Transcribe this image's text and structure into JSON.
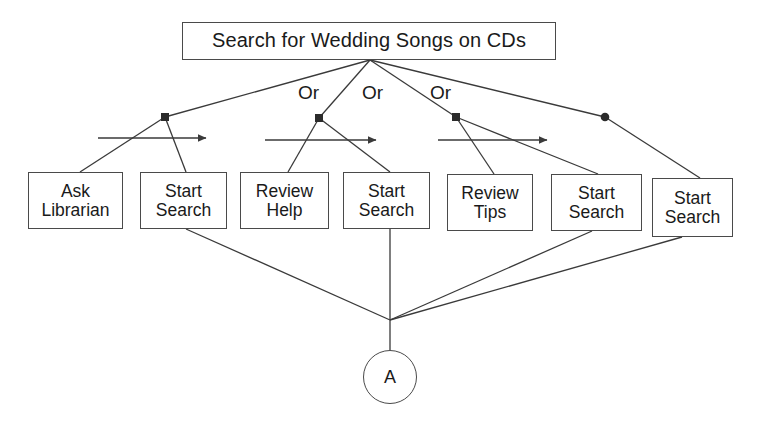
{
  "diagram": {
    "type": "decision-tree-flowchart",
    "root": {
      "label": "Search for Wedding Songs on CDs",
      "box": {
        "x": 182,
        "y": 22,
        "w": 374,
        "h": 38
      }
    },
    "connector_labels": [
      {
        "text": "Or",
        "x": 298,
        "y": 82
      },
      {
        "text": "Or",
        "x": 362,
        "y": 82
      },
      {
        "text": "Or",
        "x": 430,
        "y": 82
      }
    ],
    "branches": [
      {
        "id": "branch-1",
        "junction": {
          "x": 165,
          "y": 117
        },
        "arrow": {
          "x1": 98,
          "y1": 138,
          "x2": 212,
          "y2": 138
        },
        "nodes": [
          {
            "id": "ask-librarian",
            "line1": "Ask",
            "line2": "Librarian",
            "x": 28,
            "y": 172,
            "w": 95,
            "h": 57
          },
          {
            "id": "start-search-1",
            "line1": "Start",
            "line2": "Search",
            "x": 140,
            "y": 172,
            "w": 87,
            "h": 57
          }
        ]
      },
      {
        "id": "branch-2",
        "junction": {
          "x": 319,
          "y": 118
        },
        "arrow": {
          "x1": 265,
          "y1": 140,
          "x2": 382,
          "y2": 140
        },
        "nodes": [
          {
            "id": "review-help",
            "line1": "Review",
            "line2": "Help",
            "x": 240,
            "y": 172,
            "w": 89,
            "h": 57
          },
          {
            "id": "start-search-2",
            "line1": "Start",
            "line2": "Search",
            "x": 343,
            "y": 172,
            "w": 87,
            "h": 57
          }
        ]
      },
      {
        "id": "branch-3",
        "junction": {
          "x": 456,
          "y": 117
        },
        "arrow": {
          "x1": 438,
          "y1": 140,
          "x2": 553,
          "y2": 140
        },
        "nodes": [
          {
            "id": "review-tips",
            "line1": "Review",
            "line2": "Tips",
            "x": 447,
            "y": 174,
            "w": 86,
            "h": 57
          },
          {
            "id": "start-search-3",
            "line1": "Start",
            "line2": "Search",
            "x": 551,
            "y": 174,
            "w": 91,
            "h": 57
          }
        ]
      },
      {
        "id": "branch-4",
        "junction": {
          "x": 605,
          "y": 117
        },
        "nodes": [
          {
            "id": "start-search-4",
            "line1": "Start",
            "line2": "Search",
            "x": 652,
            "y": 178,
            "w": 81,
            "h": 59
          }
        ]
      }
    ],
    "convergence": {
      "x": 390,
      "y": 320
    },
    "terminal": {
      "label": "A",
      "cx": 390,
      "cy": 377,
      "r": 27
    },
    "colors": {
      "stroke": "#4a4a4a",
      "line": "#3a3a3a",
      "text": "#1a1a1a",
      "background": "#ffffff"
    }
  }
}
